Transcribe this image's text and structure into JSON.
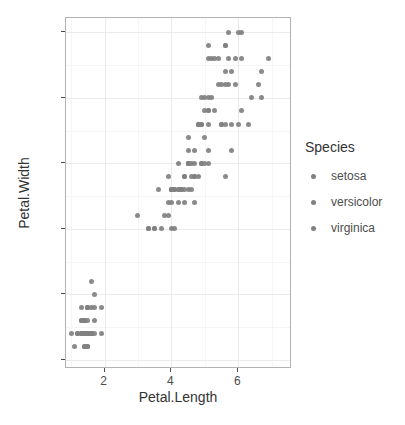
{
  "chart_data": {
    "type": "scatter",
    "title": "",
    "xlabel": "Petal.Length",
    "ylabel": "Petal.Width",
    "xlim": [
      0.85,
      7.6
    ],
    "ylim": [
      -0.07,
      2.61
    ],
    "xticks": [
      2,
      4,
      6
    ],
    "xtick_labels": [
      "2",
      "4",
      "6"
    ],
    "yticks": [
      0.0,
      0.5,
      1.0,
      1.5,
      2.0,
      2.5
    ],
    "ytick_labels": [
      "0.0",
      "0.5",
      "1.0",
      "1.5",
      "2.0",
      "2.5"
    ],
    "x_minor_ticks": [
      1,
      3,
      5,
      7
    ],
    "y_minor_ticks": [
      0.25,
      0.75,
      1.25,
      1.75,
      2.25
    ],
    "grid": true,
    "legend_position": "right",
    "legend_title": "Species",
    "point_color": "#808080",
    "panel_border_color": "#b3b3b3",
    "grid_major_color": "#ebebeb",
    "grid_minor_color": "#f5f5f5",
    "background": "#ffffff",
    "series": [
      {
        "name": "setosa",
        "color": "#808080",
        "x": [
          1.4,
          1.4,
          1.3,
          1.5,
          1.4,
          1.7,
          1.4,
          1.5,
          1.4,
          1.5,
          1.5,
          1.6,
          1.4,
          1.1,
          1.2,
          1.5,
          1.3,
          1.4,
          1.7,
          1.5,
          1.7,
          1.5,
          1.0,
          1.7,
          1.9,
          1.6,
          1.6,
          1.5,
          1.4,
          1.6,
          1.6,
          1.5,
          1.5,
          1.4,
          1.5,
          1.2,
          1.3,
          1.4,
          1.3,
          1.5,
          1.3,
          1.3,
          1.3,
          1.6,
          1.9,
          1.4,
          1.6,
          1.4,
          1.5,
          1.4
        ],
        "y": [
          0.2,
          0.2,
          0.2,
          0.2,
          0.2,
          0.4,
          0.3,
          0.2,
          0.2,
          0.1,
          0.2,
          0.2,
          0.1,
          0.1,
          0.2,
          0.4,
          0.4,
          0.3,
          0.3,
          0.3,
          0.2,
          0.4,
          0.2,
          0.5,
          0.2,
          0.2,
          0.4,
          0.2,
          0.2,
          0.2,
          0.2,
          0.4,
          0.1,
          0.2,
          0.2,
          0.2,
          0.2,
          0.1,
          0.2,
          0.2,
          0.3,
          0.3,
          0.2,
          0.6,
          0.4,
          0.3,
          0.2,
          0.2,
          0.2,
          0.2
        ]
      },
      {
        "name": "versicolor",
        "color": "#808080",
        "x": [
          4.7,
          4.5,
          4.9,
          4.0,
          4.6,
          4.5,
          4.7,
          3.3,
          4.6,
          3.9,
          3.5,
          4.2,
          4.0,
          4.7,
          3.6,
          4.4,
          4.5,
          4.1,
          4.5,
          3.9,
          4.8,
          4.0,
          4.9,
          4.7,
          4.3,
          4.4,
          4.8,
          5.0,
          4.5,
          3.5,
          3.8,
          3.7,
          3.9,
          5.1,
          4.5,
          4.5,
          4.7,
          4.4,
          4.1,
          4.0,
          4.4,
          4.6,
          4.0,
          3.3,
          4.2,
          4.2,
          4.2,
          4.3,
          3.0,
          4.1
        ],
        "y": [
          1.4,
          1.5,
          1.5,
          1.3,
          1.5,
          1.3,
          1.6,
          1.0,
          1.3,
          1.4,
          1.0,
          1.5,
          1.0,
          1.4,
          1.3,
          1.4,
          1.5,
          1.0,
          1.5,
          1.1,
          1.8,
          1.3,
          1.5,
          1.2,
          1.3,
          1.4,
          1.4,
          1.7,
          1.5,
          1.0,
          1.1,
          1.0,
          1.2,
          1.6,
          1.5,
          1.6,
          1.5,
          1.3,
          1.3,
          1.3,
          1.2,
          1.4,
          1.2,
          1.0,
          1.3,
          1.2,
          1.3,
          1.3,
          1.1,
          1.3
        ]
      },
      {
        "name": "virginica",
        "color": "#808080",
        "x": [
          6.0,
          5.1,
          5.9,
          5.6,
          5.8,
          6.6,
          4.5,
          6.3,
          5.8,
          6.1,
          5.1,
          5.3,
          5.5,
          5.0,
          5.1,
          5.3,
          5.5,
          6.7,
          6.9,
          5.0,
          5.7,
          4.9,
          6.7,
          4.9,
          5.7,
          6.0,
          4.8,
          4.9,
          5.6,
          5.8,
          6.1,
          6.4,
          5.6,
          5.1,
          5.6,
          6.1,
          5.6,
          5.5,
          4.8,
          5.4,
          5.6,
          5.1,
          5.1,
          5.9,
          5.7,
          5.2,
          5.0,
          5.2,
          5.4,
          5.1
        ],
        "y": [
          2.5,
          1.9,
          2.1,
          1.8,
          2.2,
          2.1,
          1.7,
          1.8,
          1.8,
          2.5,
          2.0,
          1.9,
          2.1,
          2.0,
          2.4,
          2.3,
          1.8,
          2.2,
          2.3,
          1.5,
          2.3,
          2.0,
          2.0,
          1.8,
          2.1,
          1.8,
          1.8,
          1.8,
          2.1,
          1.6,
          1.9,
          2.0,
          2.2,
          1.5,
          1.4,
          2.3,
          2.4,
          1.8,
          1.8,
          2.1,
          2.4,
          2.3,
          1.9,
          2.3,
          2.5,
          2.3,
          1.9,
          2.0,
          2.3,
          1.8
        ]
      }
    ]
  },
  "axes": {
    "x_title": "Petal.Length",
    "y_title": "Petal.Width"
  },
  "legend": {
    "title": "Species",
    "items": [
      {
        "label": "setosa",
        "key": "legend-key-dot"
      },
      {
        "label": "versicolor",
        "key": "legend-key-dot"
      },
      {
        "label": "virginica",
        "key": "legend-key-dot"
      }
    ]
  }
}
